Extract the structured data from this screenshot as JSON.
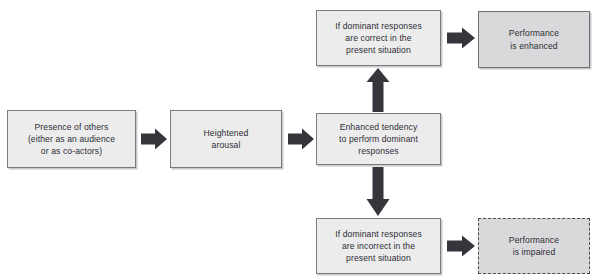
{
  "diagram": {
    "text_color": "#2d2d35",
    "process_fill": "#ececed",
    "outcome_fill": "#d9d9db",
    "border_color": "#7a7a82",
    "arrow_color": "#35353c",
    "nodes": [
      {
        "id": "presence-of-others",
        "kind": "process",
        "lines": [
          "Presence of others",
          "(either as an audience",
          "or as co-actors)"
        ]
      },
      {
        "id": "heightened-arousal",
        "kind": "process",
        "lines": [
          "Heightened",
          "arousal"
        ]
      },
      {
        "id": "enhanced-tendency",
        "kind": "process",
        "lines": [
          "Enhanced tendency",
          "to perform dominant",
          "responses"
        ]
      },
      {
        "id": "dominant-correct",
        "kind": "process",
        "lines": [
          "If dominant responses",
          "are correct in the",
          "present situation"
        ]
      },
      {
        "id": "performance-enhanced",
        "kind": "outcome",
        "lines": [
          "Performance",
          "is enhanced"
        ]
      },
      {
        "id": "dominant-incorrect",
        "kind": "process",
        "lines": [
          "If dominant responses",
          "are incorrect in the",
          "present situation"
        ]
      },
      {
        "id": "performance-impaired",
        "kind": "outcome-dashed",
        "lines": [
          "Performance",
          "is impaired"
        ]
      }
    ],
    "arrows": [
      {
        "id": "presence-to-arousal",
        "direction": "right"
      },
      {
        "id": "arousal-to-tendency",
        "direction": "right"
      },
      {
        "id": "tendency-to-correct",
        "direction": "up"
      },
      {
        "id": "tendency-to-incorrect",
        "direction": "down"
      },
      {
        "id": "correct-to-enhanced",
        "direction": "right"
      },
      {
        "id": "incorrect-to-impaired",
        "direction": "right"
      }
    ]
  }
}
